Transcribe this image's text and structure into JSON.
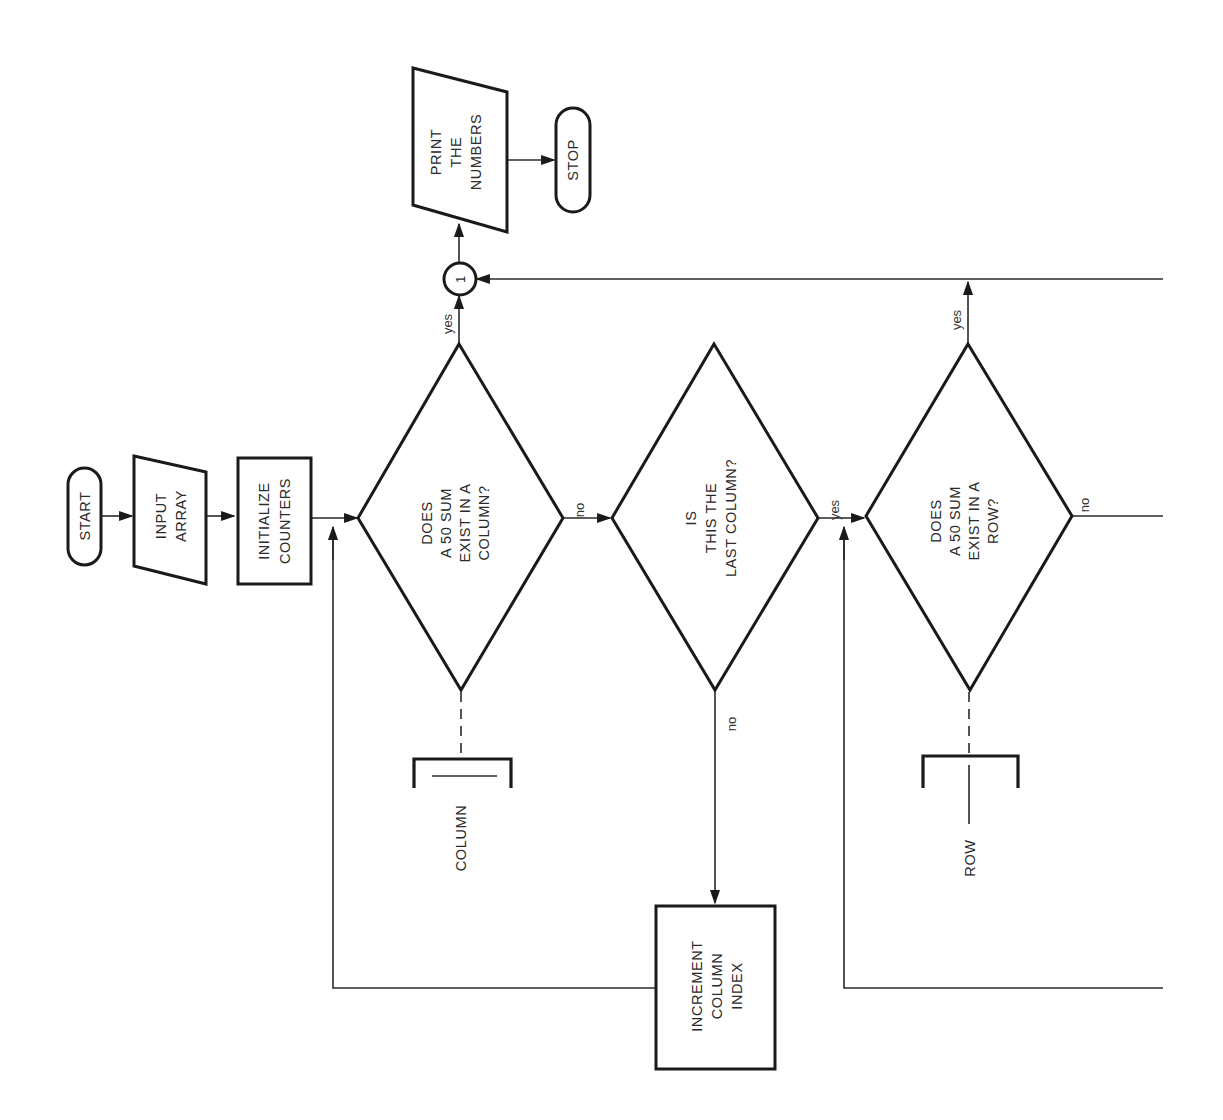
{
  "diagram": {
    "type": "flowchart",
    "orientation": "rotated-90-ccw",
    "colors": {
      "background": "#ffffff",
      "stroke": "#1a1a1a",
      "text": "#2a2a2a"
    },
    "nodes": {
      "start": {
        "shape": "terminal",
        "lines": [
          "START"
        ]
      },
      "input": {
        "shape": "input-output",
        "lines": [
          "INPUT",
          "ARRAY"
        ]
      },
      "init": {
        "shape": "process",
        "lines": [
          "INITIALIZE",
          "COUNTERS"
        ]
      },
      "col_check": {
        "shape": "decision",
        "lines": [
          "DOES",
          "A 50 SUM",
          "EXIST IN A",
          "COLUMN?"
        ]
      },
      "last_col": {
        "shape": "decision",
        "lines": [
          "IS",
          "THIS THE",
          "LAST COLUMN?"
        ]
      },
      "row_check": {
        "shape": "decision",
        "lines": [
          "DOES",
          "A 50 SUM",
          "EXIST IN A",
          "ROW?"
        ]
      },
      "increment": {
        "shape": "process",
        "lines": [
          "INCREMENT",
          "COLUMN",
          "INDEX"
        ]
      },
      "connector": {
        "shape": "connector",
        "lines": [
          "1"
        ]
      },
      "print": {
        "shape": "input-output",
        "lines": [
          "PRINT",
          "THE",
          "NUMBERS"
        ]
      },
      "stop": {
        "shape": "terminal",
        "lines": [
          "STOP"
        ]
      },
      "column_annot": {
        "shape": "annotation",
        "lines": [
          "COLUMN"
        ]
      },
      "row_annot": {
        "shape": "annotation",
        "lines": [
          "ROW"
        ]
      }
    },
    "edges": [
      {
        "from": "start",
        "to": "input",
        "label": ""
      },
      {
        "from": "input",
        "to": "init",
        "label": ""
      },
      {
        "from": "init",
        "to": "col_check",
        "label": ""
      },
      {
        "from": "col_check",
        "to": "connector",
        "label": "yes"
      },
      {
        "from": "col_check",
        "to": "last_col",
        "label": "no"
      },
      {
        "from": "last_col",
        "to": "row_check",
        "label": "yes"
      },
      {
        "from": "last_col",
        "to": "increment",
        "label": "no"
      },
      {
        "from": "increment",
        "to": "col_check",
        "label": ""
      },
      {
        "from": "row_check",
        "to": "connector",
        "label": "yes"
      },
      {
        "from": "row_check",
        "to": "off-page",
        "label": "no"
      },
      {
        "from": "connector",
        "to": "print",
        "label": ""
      },
      {
        "from": "print",
        "to": "stop",
        "label": ""
      }
    ],
    "edge_labels": {
      "col_yes": "yes",
      "col_no": "no",
      "last_yes": "yes",
      "last_no": "no",
      "row_yes": "yes",
      "row_no": "no"
    }
  }
}
